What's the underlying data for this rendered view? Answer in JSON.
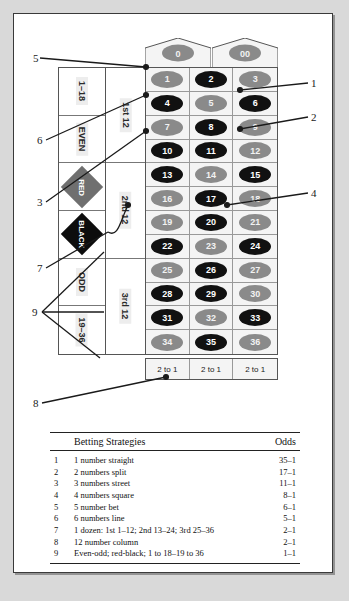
{
  "board": {
    "zeros": [
      {
        "label": "0",
        "color": "green"
      },
      {
        "label": "00",
        "color": "green"
      }
    ],
    "numbers": [
      {
        "label": "1",
        "color": "red"
      },
      {
        "label": "2",
        "color": "black"
      },
      {
        "label": "3",
        "color": "red"
      },
      {
        "label": "4",
        "color": "black"
      },
      {
        "label": "5",
        "color": "red"
      },
      {
        "label": "6",
        "color": "black"
      },
      {
        "label": "7",
        "color": "red"
      },
      {
        "label": "8",
        "color": "black"
      },
      {
        "label": "9",
        "color": "red"
      },
      {
        "label": "10",
        "color": "black"
      },
      {
        "label": "11",
        "color": "black"
      },
      {
        "label": "12",
        "color": "red"
      },
      {
        "label": "13",
        "color": "black"
      },
      {
        "label": "14",
        "color": "red"
      },
      {
        "label": "15",
        "color": "black"
      },
      {
        "label": "16",
        "color": "red"
      },
      {
        "label": "17",
        "color": "black"
      },
      {
        "label": "18",
        "color": "red"
      },
      {
        "label": "19",
        "color": "red"
      },
      {
        "label": "20",
        "color": "black"
      },
      {
        "label": "21",
        "color": "red"
      },
      {
        "label": "22",
        "color": "black"
      },
      {
        "label": "23",
        "color": "red"
      },
      {
        "label": "24",
        "color": "black"
      },
      {
        "label": "25",
        "color": "red"
      },
      {
        "label": "26",
        "color": "black"
      },
      {
        "label": "27",
        "color": "red"
      },
      {
        "label": "28",
        "color": "black"
      },
      {
        "label": "29",
        "color": "black"
      },
      {
        "label": "30",
        "color": "red"
      },
      {
        "label": "31",
        "color": "black"
      },
      {
        "label": "32",
        "color": "red"
      },
      {
        "label": "33",
        "color": "black"
      },
      {
        "label": "34",
        "color": "red"
      },
      {
        "label": "35",
        "color": "black"
      },
      {
        "label": "36",
        "color": "red"
      }
    ],
    "column_bets": [
      "2 to 1",
      "2 to 1",
      "2 to 1"
    ],
    "outside_bets": [
      {
        "label": "1–18",
        "style": "text"
      },
      {
        "label": "EVEN",
        "style": "text"
      },
      {
        "label": "RED",
        "style": "diamond-red"
      },
      {
        "label": "BLACK",
        "style": "diamond-black"
      },
      {
        "label": "ODD",
        "style": "text"
      },
      {
        "label": "19–36",
        "style": "text"
      }
    ],
    "dozens": [
      "1st 12",
      "2nd 12",
      "3rd 12"
    ]
  },
  "callouts": {
    "left": [
      "5",
      "6",
      "3",
      "7",
      "9",
      "8"
    ],
    "right": [
      "1",
      "2",
      "4"
    ]
  },
  "table": {
    "headers": [
      "Betting Strategies",
      "Odds"
    ],
    "rows": [
      {
        "index": "1",
        "desc": "1 number straight",
        "odds": "35–1"
      },
      {
        "index": "2",
        "desc": "2 numbers split",
        "odds": "17–1"
      },
      {
        "index": "3",
        "desc": "3 numbers street",
        "odds": "11–1"
      },
      {
        "index": "4",
        "desc": "4 numbers square",
        "odds": "8–1"
      },
      {
        "index": "5",
        "desc": "5 number bet",
        "odds": "6–1"
      },
      {
        "index": "6",
        "desc": "6 numbers line",
        "odds": "5–1"
      },
      {
        "index": "7",
        "desc": "1 dozen: 1st 1–12; 2nd 13–24; 3rd 25–36",
        "odds": "2–1"
      },
      {
        "index": "8",
        "desc": "12 number column",
        "odds": "2–1"
      },
      {
        "index": "9",
        "desc": "Even-odd; red-black; 1 to 18–19 to 36",
        "odds": "1–1"
      }
    ]
  },
  "colors": {
    "red_cell": "#8a8a8a",
    "black_cell": "#111111",
    "panel_bg": "#ffffff",
    "page_bg": "#d9d9d9"
  }
}
